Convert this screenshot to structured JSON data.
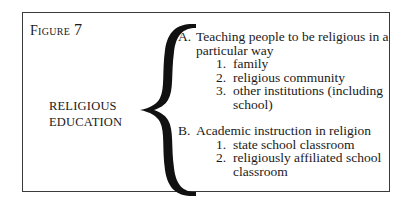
{
  "figure": {
    "label_word": "Figure",
    "label_number": "7",
    "root": {
      "line1": "RELIGIOUS",
      "line2": "EDUCATION"
    },
    "branches": [
      {
        "letter": "A.",
        "title": "Teaching people to be religious in a particular way",
        "items": [
          {
            "num": "1.",
            "text": "family"
          },
          {
            "num": "2.",
            "text": "religious community"
          },
          {
            "num": "3.",
            "text": "other institutions (including school)"
          }
        ]
      },
      {
        "letter": "B.",
        "title": "Academic instruction in religion",
        "items": [
          {
            "num": "1.",
            "text": "state school classroom"
          },
          {
            "num": "2.",
            "text": "religiously affiliated school classroom"
          }
        ]
      }
    ]
  }
}
